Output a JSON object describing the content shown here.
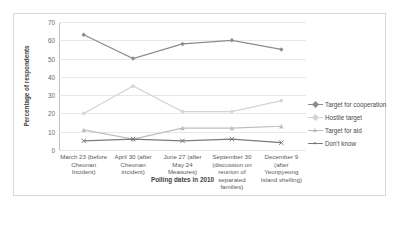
{
  "chart_data": {
    "type": "line",
    "title": "",
    "xlabel": "Polling dates in 2010",
    "ylabel": "Percentage of respondents",
    "ylim": [
      0,
      70
    ],
    "yticks": [
      0,
      10,
      20,
      30,
      40,
      50,
      60,
      70
    ],
    "grid": true,
    "legend_position": "right",
    "categories": [
      "March 23 (before Cheonan Incident)",
      "April 30 (after Cheonan incident)",
      "June 27 (after May 24 Measures)",
      "September 30 (discussion on reunion of separated families)",
      "December 9 (after Yeonpyeong Island shelling)"
    ],
    "series": [
      {
        "name": "Target for cooperation",
        "values": [
          63,
          50,
          58,
          60,
          55
        ],
        "color": "#8c8c8c",
        "marker": "diamond"
      },
      {
        "name": "Hostile target",
        "values": [
          20,
          35,
          21,
          21,
          27
        ],
        "color": "#d4d4d4",
        "marker": "diamond"
      },
      {
        "name": "Target for aid",
        "values": [
          11,
          6,
          12,
          12,
          13
        ],
        "color": "#bdbdbd",
        "marker": "triangle"
      },
      {
        "name": "Don't know",
        "values": [
          5,
          6,
          5,
          6,
          4
        ],
        "color": "#7a7a7a",
        "marker": "cross"
      }
    ]
  },
  "ytick_labels": [
    "70",
    "60",
    "50",
    "40",
    "30",
    "20",
    "10",
    "0"
  ],
  "legend": {
    "items": [
      {
        "label": "Target for cooperation"
      },
      {
        "label": "Hostile target"
      },
      {
        "label": "Target for aid"
      },
      {
        "label": "Don't know"
      }
    ]
  }
}
